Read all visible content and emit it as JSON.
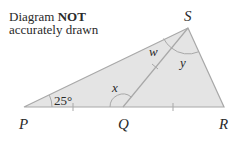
{
  "note": {
    "line1_prefix": "Diagram ",
    "line1_bold": "NOT",
    "line2": "accurately drawn"
  },
  "points": {
    "P": {
      "label": "P",
      "x": 24,
      "y": 107
    },
    "Q": {
      "label": "Q",
      "x": 123,
      "y": 107
    },
    "R": {
      "label": "R",
      "x": 224,
      "y": 107
    },
    "S": {
      "label": "S",
      "x": 188,
      "y": 28
    }
  },
  "angles": {
    "P": "25°",
    "Q": "x",
    "S_left": "w",
    "S_right": "y"
  },
  "equal_marks": [
    "PQ",
    "QR",
    "QS"
  ],
  "colors": {
    "fill": "#e4e4e4",
    "stroke": "#a8a8a8",
    "text": "#2a2a2a"
  }
}
